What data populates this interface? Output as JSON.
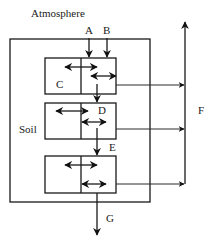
{
  "diagram": {
    "labels": {
      "atmosphere": "Atmosphere",
      "soil": "Soil",
      "a": "A",
      "b": "B",
      "c": "C",
      "d": "D",
      "e": "E",
      "f": "F",
      "g": "G"
    },
    "layers": [
      {
        "name": "top-layer",
        "label": "C"
      },
      {
        "name": "middle-layer",
        "label": "D"
      },
      {
        "name": "bottom-layer",
        "label": ""
      }
    ],
    "colors": {
      "line": "#1a1a1a",
      "background": "#ffffff"
    }
  }
}
